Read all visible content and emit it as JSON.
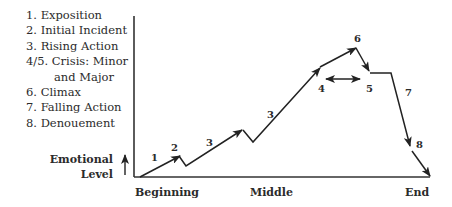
{
  "legend": {
    "items": [
      "1. Exposition",
      "2. Initial Incident",
      "3. Rising Action",
      "4/5. Crisis: Minor",
      "and Major",
      "6. Climax",
      "7. Falling Action",
      "8. Denouement"
    ]
  },
  "axes": {
    "y_label_line1": "Emotional",
    "y_label_line2": "Level",
    "x_ticks": [
      "Beginning",
      "Middle",
      "End"
    ]
  },
  "points": {
    "p1": "1",
    "p2": "2",
    "p3a": "3",
    "p3b": "3",
    "p4": "4",
    "p5": "5",
    "p6": "6",
    "p7": "7",
    "p8": "8"
  }
}
